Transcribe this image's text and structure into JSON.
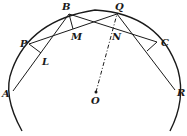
{
  "diagram": {
    "type": "geometry",
    "points": {
      "A": {
        "label": "A",
        "x": 13,
        "y": 91
      },
      "P": {
        "label": "P",
        "x": 29,
        "y": 44
      },
      "B": {
        "label": "B",
        "x": 69,
        "y": 14
      },
      "Q": {
        "label": "Q",
        "x": 117,
        "y": 14
      },
      "C": {
        "label": "C",
        "x": 157,
        "y": 42
      },
      "R": {
        "label": "R",
        "x": 175,
        "y": 90
      },
      "O": {
        "label": "O",
        "x": 96,
        "y": 92
      },
      "L": {
        "label": "L",
        "x": 41,
        "y": 52
      },
      "M": {
        "label": "M",
        "x": 73,
        "y": 31
      },
      "N": {
        "label": "N",
        "x": 110,
        "y": 31
      }
    },
    "labels": {
      "A": "A",
      "B": "B",
      "C": "C",
      "L": "L",
      "M": "M",
      "N": "N",
      "O": "O",
      "P": "P",
      "Q": "Q",
      "R": "R"
    },
    "segments": [
      {
        "from": "A",
        "to": "B",
        "style": "solid"
      },
      {
        "from": "P",
        "to": "Q",
        "style": "solid"
      },
      {
        "from": "B",
        "to": "C",
        "style": "solid"
      },
      {
        "from": "Q",
        "to": "R",
        "style": "solid"
      },
      {
        "from": "P",
        "to": "L",
        "style": "solid"
      },
      {
        "from": "B",
        "to": "M",
        "style": "solid"
      },
      {
        "from": "C",
        "to": "QR-foot",
        "style": "solid"
      },
      {
        "from": "O",
        "to": "Q",
        "style": "dashed"
      }
    ],
    "colors": {
      "stroke": "#1a1a1a",
      "background": "#ffffff"
    }
  }
}
